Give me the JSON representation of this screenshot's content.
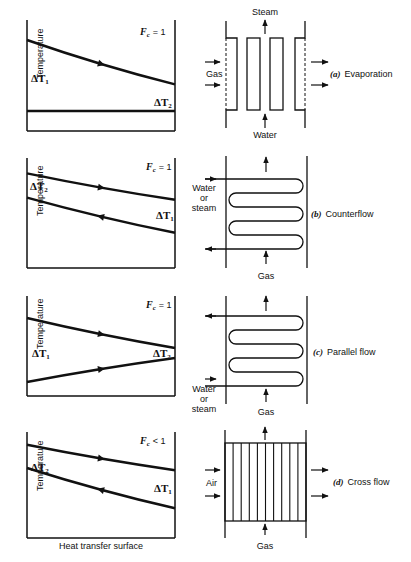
{
  "figure": {
    "x_axis_label": "Heat transfer surface",
    "y_axis_label": "Temperature",
    "panels": [
      {
        "id": "a",
        "caption_letter": "(a)",
        "caption": "Evaporation",
        "fc_symbol": "F",
        "fc_sub": "c",
        "fc_relation": "= 1",
        "delta_left": {
          "sym": "ΔT",
          "sub": "1"
        },
        "delta_right": {
          "sym": "ΔT",
          "sub": "2"
        },
        "hot_curve": {
          "start": 0.82,
          "end": 0.42,
          "direction": "right"
        },
        "cold_curve": {
          "start": 0.18,
          "end": 0.18,
          "direction": "none"
        },
        "labels": {
          "top": "Steam",
          "bottom": "Water",
          "left": "Gas"
        }
      },
      {
        "id": "b",
        "caption_letter": "(b)",
        "caption": "Counterflow",
        "fc_symbol": "F",
        "fc_sub": "c",
        "fc_relation": "= 1",
        "delta_left": {
          "sym": "ΔT",
          "sub": "2"
        },
        "delta_right": {
          "sym": "ΔT",
          "sub": "1"
        },
        "hot_curve": {
          "start": 0.86,
          "end": 0.62,
          "direction": "right"
        },
        "cold_curve": {
          "start": 0.64,
          "end": 0.32,
          "direction": "left"
        },
        "labels": {
          "inlet": "Water or steam",
          "bottom": "Gas",
          "inlet_line1": "Water",
          "inlet_line2": "or",
          "inlet_line3": "steam"
        }
      },
      {
        "id": "c",
        "caption_letter": "(c)",
        "caption": "Parallel flow",
        "fc_symbol": "F",
        "fc_sub": "c",
        "fc_relation": "= 1",
        "delta_left": {
          "sym": "ΔT",
          "sub": "1"
        },
        "delta_right": {
          "sym": "ΔT",
          "sub": "2"
        },
        "hot_curve": {
          "start": 0.78,
          "end": 0.48,
          "direction": "right"
        },
        "cold_curve": {
          "start": 0.14,
          "end": 0.38,
          "direction": "right"
        },
        "labels": {
          "bottom": "Gas",
          "inlet_line1": "Water",
          "inlet_line2": "or",
          "inlet_line3": "steam"
        }
      },
      {
        "id": "d",
        "caption_letter": "(d)",
        "caption": "Cross flow",
        "fc_symbol": "F",
        "fc_sub": "c",
        "fc_relation": "< 1",
        "delta_left": {
          "sym": "ΔT",
          "sub": "2"
        },
        "delta_right": {
          "sym": "ΔT",
          "sub": "1"
        },
        "hot_curve": {
          "start": 0.88,
          "end": 0.64,
          "direction": "right"
        },
        "cold_curve": {
          "start": 0.66,
          "end": 0.28,
          "direction": "left"
        },
        "labels": {
          "left": "Air",
          "bottom": "Gas"
        }
      }
    ]
  }
}
